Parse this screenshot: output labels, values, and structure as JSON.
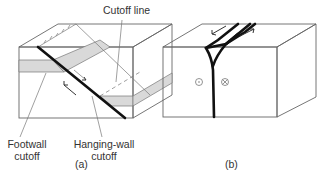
{
  "figure": {
    "panel_a": {
      "label": "(a)",
      "annotations": {
        "cutoff_line": "Cutoff line",
        "footwall_cutoff": [
          "Footwall",
          "cutoff"
        ],
        "hangingwall_cutoff": [
          "Hanging-wall",
          "cutoff"
        ]
      }
    },
    "panel_b": {
      "label": "(b)",
      "symbols": {
        "out_of_page": "⊙",
        "into_page": "⊗"
      }
    },
    "colors": {
      "line": "#666666",
      "fault": "#111111",
      "bed_fill": "#d9d9d9",
      "background": "#ffffff"
    }
  }
}
